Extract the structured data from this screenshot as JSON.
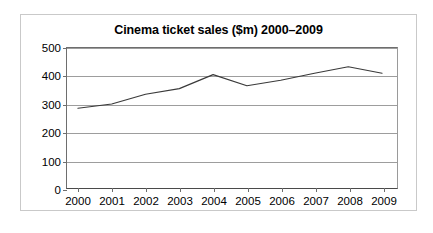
{
  "chart_data": {
    "type": "line",
    "title": "Cinema ticket sales ($m) 2000–2009",
    "xlabel": "",
    "ylabel": "",
    "categories": [
      "2000",
      "2001",
      "2002",
      "2003",
      "2004",
      "2005",
      "2006",
      "2007",
      "2008",
      "2009"
    ],
    "values": [
      285,
      300,
      335,
      355,
      405,
      365,
      385,
      410,
      433,
      410
    ],
    "series": [
      {
        "name": "Cinema ticket sales ($m)",
        "values": [
          285,
          300,
          335,
          355,
          405,
          365,
          385,
          410,
          433,
          410
        ]
      }
    ],
    "ylim": [
      0,
      500
    ],
    "yticks": [
      0,
      100,
      200,
      300,
      400,
      500
    ],
    "ytick_labels": [
      "0",
      "100",
      "200",
      "300",
      "400",
      "500"
    ],
    "xtick_labels": [
      "2000",
      "2001",
      "2002",
      "2003",
      "2004",
      "2005",
      "2006",
      "2007",
      "2008",
      "2009"
    ],
    "grid": "horizontal",
    "legend": "none",
    "markers": "none",
    "colors": {
      "line": "#3a3a3a",
      "gridline": "#9d9d9d",
      "axis": "#6e6e6e",
      "text": "#000000",
      "background": "#ffffff",
      "frame": "#c9c9c9"
    }
  }
}
